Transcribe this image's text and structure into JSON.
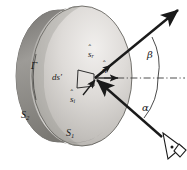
{
  "figure": {
    "type": "optics-scattering-diagram",
    "background_color": "#ffffff",
    "ink_color": "#1a1a1a"
  },
  "labels": {
    "gamma": "Γ",
    "surface_front": "S",
    "surface_front_sub": "1",
    "surface_back": "S",
    "surface_back_sub": "2",
    "patch": "ds′",
    "normal_vector": "n",
    "scattered_vector": "s",
    "scattered_vector_sub": "r",
    "incident_vector": "s",
    "incident_vector_sub": "i",
    "angle_beta": "β",
    "angle_alpha": "α",
    "hat_mark": "ˆ"
  },
  "geometry": {
    "disk_center": [
      95,
      78
    ],
    "patch_origin": [
      95,
      78
    ],
    "scattered_ray_tip": [
      180,
      8
    ],
    "incident_ray_source": [
      166,
      142
    ],
    "axis_y": 78,
    "angle_beta_deg": 39,
    "angle_alpha_deg": 38
  },
  "colors": {
    "disk_light": "#e6e4e1",
    "disk_mid": "#b9b7b3",
    "disk_dark": "#8c8a86",
    "disk_shadow": "#6e6c69",
    "line": "#1a1a1a",
    "dash": "#4a4a4a"
  }
}
